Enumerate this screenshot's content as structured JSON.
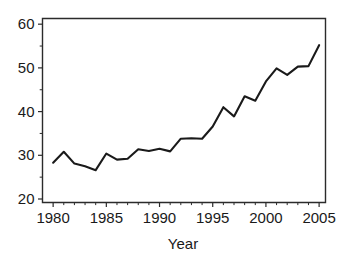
{
  "chart_data": {
    "type": "line",
    "title": "",
    "subtitle": "",
    "xlabel": "Year",
    "ylabel": "",
    "xlim": [
      1979.0,
      2005.6
    ],
    "ylim": [
      19.2,
      61.3
    ],
    "grid": false,
    "legend": null,
    "legend_position": "none",
    "x_ticks": [
      1980,
      1985,
      1990,
      1995,
      2000,
      2005
    ],
    "x_tick_labels": [
      "1980",
      "1985",
      "1990",
      "1995",
      "2000",
      "2005"
    ],
    "x_minor_ticks": [
      1981,
      1982,
      1983,
      1984,
      1986,
      1987,
      1988,
      1989,
      1991,
      1992,
      1993,
      1994,
      1996,
      1997,
      1998,
      1999,
      2001,
      2002,
      2003,
      2004
    ],
    "y_ticks": [
      20,
      30,
      40,
      50,
      60
    ],
    "y_tick_labels": [
      "20",
      "30",
      "40",
      "50",
      "60"
    ],
    "y_minor_ticks": [
      25,
      35,
      45,
      55
    ],
    "line_color": "#1a1a1a",
    "x": [
      1980,
      1981,
      1982,
      1983,
      1984,
      1985,
      1986,
      1987,
      1988,
      1989,
      1990,
      1991,
      1992,
      1993,
      1994,
      1995,
      1996,
      1997,
      1998,
      1999,
      2000,
      2001,
      2002,
      2003,
      2004,
      2005
    ],
    "series": [
      {
        "name": "value",
        "values": [
          28.3,
          30.8,
          28.1,
          27.5,
          26.6,
          30.4,
          29.0,
          29.2,
          31.4,
          31.0,
          31.5,
          30.9,
          33.8,
          33.9,
          33.8,
          36.6,
          41.0,
          38.9,
          43.5,
          42.5,
          46.9,
          49.9,
          48.4,
          50.3,
          50.4,
          55.2
        ]
      }
    ]
  },
  "figure": {
    "background_color": "#ffffff",
    "frame_color": "#2b2b2b",
    "text_color": "#1a1a1a"
  }
}
